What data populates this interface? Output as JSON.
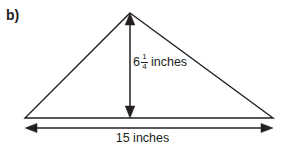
{
  "figure": {
    "part_label": "b)",
    "shape": "triangle",
    "stroke_color": "#231f20",
    "background_color": "#ffffff",
    "height_dimension": {
      "whole": "6",
      "numerator": "1",
      "denominator": "4",
      "unit": "inches",
      "full_text": "6 1/4 inches"
    },
    "base_dimension": {
      "value": "15",
      "unit": "inches",
      "full_text": "15 inches"
    },
    "geometry": {
      "apex_x": 130,
      "apex_y": 13,
      "left_x": 25,
      "left_y": 118,
      "right_x": 273,
      "right_y": 118,
      "base_arrow_y": 128,
      "height_arrow_x": 130
    }
  }
}
